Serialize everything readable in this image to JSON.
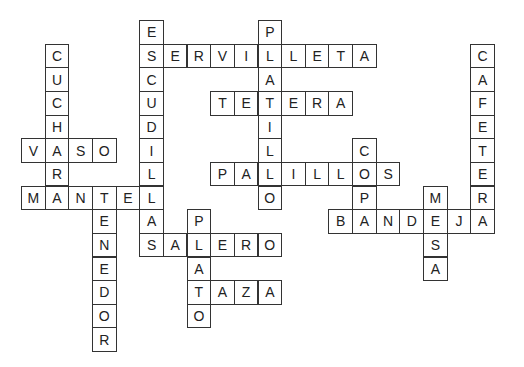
{
  "puzzle": {
    "type": "crossword",
    "grid": {
      "origin_x": 21,
      "origin_y": 20,
      "cell": 23.65
    },
    "words": [
      {
        "word": "ESCUDILLAS",
        "dir": "down",
        "row": 0,
        "col": 5
      },
      {
        "word": "SERVILLETA",
        "dir": "across",
        "row": 1,
        "col": 5
      },
      {
        "word": "PLATILLO",
        "dir": "down",
        "row": 0,
        "col": 10
      },
      {
        "word": "TETERA",
        "dir": "across",
        "row": 3,
        "col": 8
      },
      {
        "word": "CUCHARA",
        "dir": "down",
        "row": 1,
        "col": 1
      },
      {
        "word": "VASO",
        "dir": "across",
        "row": 5,
        "col": 0
      },
      {
        "word": "PALILLOS",
        "dir": "across",
        "row": 6,
        "col": 8
      },
      {
        "word": "COPA",
        "dir": "down",
        "row": 5,
        "col": 14
      },
      {
        "word": "CAFETERA",
        "dir": "down",
        "row": 1,
        "col": 19
      },
      {
        "word": "MESA",
        "dir": "down",
        "row": 7,
        "col": 17
      },
      {
        "word": "BANDEJA",
        "dir": "across",
        "row": 8,
        "col": 13
      },
      {
        "word": "MANTEL",
        "dir": "across",
        "row": 7,
        "col": 0
      },
      {
        "word": "TENEDOR",
        "dir": "down",
        "row": 7,
        "col": 3
      },
      {
        "word": "SALERO",
        "dir": "across",
        "row": 9,
        "col": 5
      },
      {
        "word": "PLATO",
        "dir": "down",
        "row": 8,
        "col": 7
      },
      {
        "word": "TAZA",
        "dir": "across",
        "row": 11,
        "col": 7
      }
    ]
  }
}
